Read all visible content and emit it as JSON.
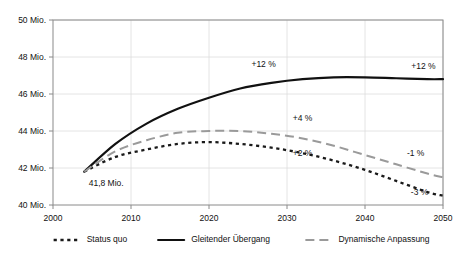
{
  "chart_data": {
    "type": "line",
    "title": "",
    "xlabel": "",
    "ylabel": "",
    "xlim": [
      2000,
      2050
    ],
    "ylim": [
      40,
      50
    ],
    "grid": true,
    "legend_position": "bottom",
    "x_ticks": [
      "2000",
      "2010",
      "2020",
      "2030",
      "2040",
      "2050"
    ],
    "x_tick_values": [
      2000,
      2010,
      2020,
      2030,
      2040,
      2050
    ],
    "y_ticks": [
      "40 Mio.",
      "42 Mio.",
      "44 Mio.",
      "46 Mio.",
      "48 Mio.",
      "50 Mio."
    ],
    "y_tick_values": [
      40,
      42,
      44,
      46,
      48,
      50
    ],
    "start_label": "41,8 Mio.",
    "start_point": {
      "x": 2004,
      "y": 41.8
    },
    "series": [
      {
        "name": "Status quo",
        "style": "dotted",
        "color": "#1a1a1a",
        "x": [
          2004,
          2008,
          2012,
          2016,
          2020,
          2024,
          2028,
          2032,
          2036,
          2040,
          2044,
          2048,
          2050
        ],
        "values": [
          41.8,
          42.6,
          43.0,
          43.3,
          43.4,
          43.3,
          43.1,
          42.8,
          42.4,
          41.9,
          41.3,
          40.7,
          40.5
        ]
      },
      {
        "name": "Gleitender Übergang",
        "style": "solid",
        "color": "#111111",
        "x": [
          2004,
          2008,
          2012,
          2016,
          2020,
          2024,
          2028,
          2032,
          2036,
          2040,
          2044,
          2048,
          2050
        ],
        "values": [
          41.8,
          43.3,
          44.4,
          45.2,
          45.8,
          46.3,
          46.6,
          46.8,
          46.9,
          46.9,
          46.85,
          46.8,
          46.8
        ]
      },
      {
        "name": "Dynamische Anpassung",
        "style": "dashed",
        "color": "#9a9a9a",
        "x": [
          2004,
          2008,
          2012,
          2016,
          2020,
          2024,
          2028,
          2032,
          2036,
          2040,
          2044,
          2048,
          2050
        ],
        "values": [
          41.8,
          42.9,
          43.5,
          43.9,
          44.0,
          44.0,
          43.85,
          43.6,
          43.2,
          42.7,
          42.2,
          41.7,
          41.5
        ]
      }
    ],
    "annotations": [
      {
        "text": "+12 %",
        "x": 2027,
        "y": 47.45,
        "series": "Gleitender Übergang"
      },
      {
        "text": "+12 %",
        "x": 2047.5,
        "y": 47.35,
        "series": "Gleitender Übergang"
      },
      {
        "text": "+4 %",
        "x": 2032,
        "y": 44.55,
        "series": "Dynamische Anpassung"
      },
      {
        "text": "+2 %",
        "x": 2032,
        "y": 42.65,
        "series": "Status quo"
      },
      {
        "text": "-1 %",
        "x": 2046.5,
        "y": 42.65,
        "series": "Dynamische Anpassung"
      },
      {
        "text": "-3 %",
        "x": 2047,
        "y": 40.55,
        "series": "Status quo"
      }
    ],
    "legend": [
      {
        "label": "Status quo",
        "style": "dotted",
        "color": "#1a1a1a"
      },
      {
        "label": "Gleitender Übergang",
        "style": "solid",
        "color": "#111111"
      },
      {
        "label": "Dynamische Anpassung",
        "style": "dashed",
        "color": "#9a9a9a"
      }
    ]
  },
  "colors": {
    "background": "#ffffff",
    "axis": "#8a8a8a",
    "grid": "#dddddd",
    "text": "#111111"
  }
}
